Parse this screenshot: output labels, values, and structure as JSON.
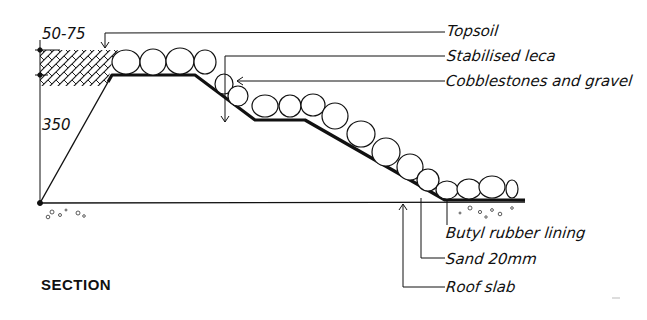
{
  "diagram": {
    "title": "SECTION",
    "dimensions": {
      "topsoil_depth": "50-75",
      "height": "350"
    },
    "labels": {
      "topsoil": "Topsoil",
      "stabilised_leca": "Stabilised leca",
      "cobblestones": "Cobblestones and gravel",
      "butyl": "Butyl rubber lining",
      "sand": "Sand 20mm",
      "roof_slab": "Roof slab"
    },
    "colors": {
      "ink": "#111111",
      "background": "#ffffff"
    }
  }
}
